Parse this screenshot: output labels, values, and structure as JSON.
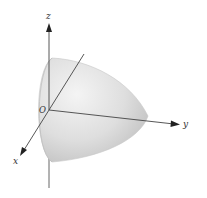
{
  "figure": {
    "type": "3d-surface-diagram",
    "surface": "paraboloid opening along negative y-direction, vertex on positive y-axis",
    "axes": {
      "z": {
        "label": "z"
      },
      "y": {
        "label": "y"
      },
      "x": {
        "label": "x"
      },
      "origin": {
        "label": "O"
      }
    },
    "colors": {
      "axis": "#444444",
      "surface_light": "#f2f2f2",
      "surface_mid": "#d9d9d9",
      "surface_dark": "#b8b8b8",
      "background": "#ffffff"
    }
  }
}
